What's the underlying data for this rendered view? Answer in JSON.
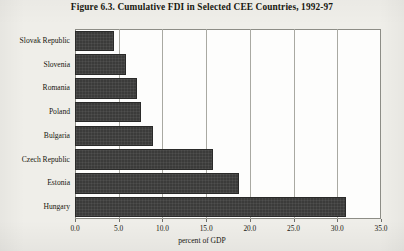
{
  "figure": {
    "title": "Figure 6.3.  Cumulative FDI in Selected CEE Countries, 1992-97"
  },
  "chart_data": {
    "type": "bar",
    "orientation": "horizontal",
    "title": "Figure 6.3.  Cumulative FDI in Selected CEE Countries, 1992-97",
    "categories": [
      "Slovak Republic",
      "Slovenia",
      "Romania",
      "Poland",
      "Bulgaria",
      "Czech Republic",
      "Estonia",
      "Hungary"
    ],
    "values": [
      4.5,
      5.8,
      7.1,
      7.5,
      8.9,
      15.8,
      18.8,
      31.0
    ],
    "xlabel": "percent of GDP",
    "ylabel": "",
    "xlim": [
      0.0,
      35.0
    ],
    "xticks": [
      0.0,
      5.0,
      10.0,
      15.0,
      20.0,
      25.0,
      30.0,
      35.0
    ],
    "xtick_labels": [
      "0.0",
      "5.0",
      "10.0",
      "15.0",
      "20.0",
      "25.0",
      "30.0",
      "35.0"
    ],
    "grid": "vertical",
    "legend": "none",
    "bar_color": "#3b3b3a",
    "plot_background": "#fdfdfc"
  }
}
